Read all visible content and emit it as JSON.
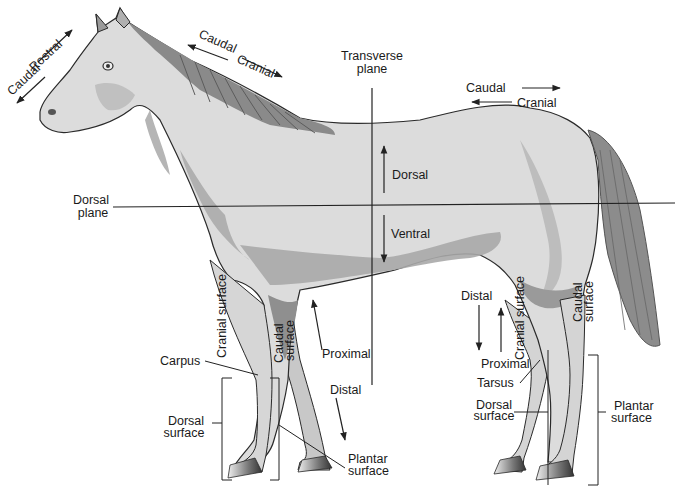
{
  "diagram": {
    "colors": {
      "body_fill": "#d9d9d9",
      "body_light": "#e8e8e8",
      "shadow": "#a8a8a8",
      "dark_shadow": "#8a8a8a",
      "mane": "#7a7a7a",
      "outline": "#2a2a2a",
      "line": "#222222",
      "hoof": "#555555"
    },
    "labels": {
      "head_caudal": "Caudal",
      "head_rostral": "Rostral",
      "neck_caudal": "Caudal",
      "neck_cranial": "Cranial",
      "transverse_plane_1": "Transverse",
      "transverse_plane_2": "plane",
      "back_caudal": "Caudal",
      "back_cranial": "Cranial",
      "dorsal_plane_1": "Dorsal",
      "dorsal_plane_2": "plane",
      "dorsal": "Dorsal",
      "ventral": "Ventral",
      "fore_cranial_surface": "Cranial surface",
      "fore_caudal_surface_1": "Caudal",
      "fore_caudal_surface_2": "surface",
      "carpus": "Carpus",
      "fore_proximal": "Proximal",
      "fore_distal": "Distal",
      "fore_dorsal_surface_1": "Dorsal",
      "fore_dorsal_surface_2": "surface",
      "fore_plantar_surface_1": "Plantar",
      "fore_plantar_surface_2": "surface",
      "hind_distal": "Distal",
      "hind_cranial_surface": "Cranial surface",
      "hind_caudal_surface_1": "Caudal",
      "hind_caudal_surface_2": "surface",
      "hind_proximal": "Proximal",
      "tarsus": "Tarsus",
      "hind_dorsal_surface_1": "Dorsal",
      "hind_dorsal_surface_2": "surface",
      "hind_plantar_surface_1": "Plantar",
      "hind_plantar_surface_2": "surface"
    }
  }
}
